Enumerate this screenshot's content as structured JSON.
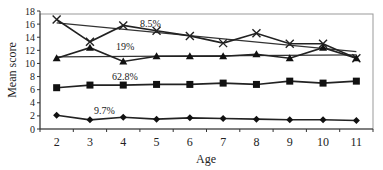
{
  "chart_data": {
    "type": "line",
    "title": "",
    "xlabel": "Age",
    "ylabel": "Mean score",
    "categories": [
      "2",
      "3",
      "4",
      "5",
      "6",
      "7",
      "8",
      "9",
      "10",
      "11"
    ],
    "ylim": [
      0,
      18
    ],
    "yticks": [
      0,
      2,
      4,
      6,
      8,
      10,
      12,
      14,
      16,
      18
    ],
    "grid": false,
    "legend": "none",
    "series": [
      {
        "name": "8.5%",
        "marker": "x",
        "values": [
          16.7,
          13.3,
          15.8,
          15.0,
          14.2,
          13.1,
          14.6,
          13.0,
          13.0,
          10.8
        ],
        "trendline": [
          16.2,
          11.8
        ]
      },
      {
        "name": "19%",
        "marker": "triangle",
        "values": [
          10.8,
          12.4,
          10.3,
          11.1,
          11.1,
          11.1,
          11.4,
          10.8,
          12.4,
          10.8
        ],
        "trendline": [
          11.0,
          11.3
        ]
      },
      {
        "name": "62.8%",
        "marker": "square",
        "values": [
          6.3,
          6.7,
          6.7,
          6.8,
          6.8,
          7.0,
          6.8,
          7.3,
          7.0,
          7.3
        ]
      },
      {
        "name": "9.7%",
        "marker": "diamond",
        "values": [
          2.1,
          1.4,
          1.8,
          1.5,
          1.7,
          1.6,
          1.5,
          1.4,
          1.4,
          1.3
        ]
      }
    ],
    "annotations": [
      {
        "text": "8.5%",
        "x_px": 140,
        "y_px": 27
      },
      {
        "text": "19%",
        "x_px": 116,
        "y_px": 50
      },
      {
        "text": "62.8%",
        "x_px": 112,
        "y_px": 80
      },
      {
        "text": "9.7%",
        "x_px": 94,
        "y_px": 114
      }
    ]
  }
}
